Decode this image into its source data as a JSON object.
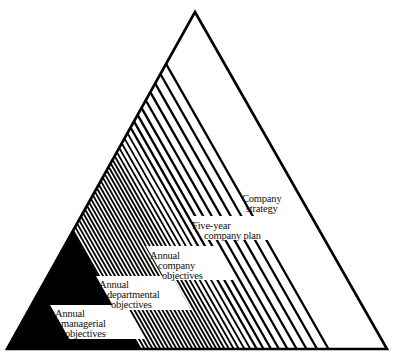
{
  "diagram": {
    "type": "pyramid-hierarchy",
    "triangle": {
      "apex": [
        195,
        12
      ],
      "base_left": [
        7,
        349
      ],
      "base_right": [
        387,
        349
      ],
      "stroke": "#000000",
      "fill": "#ffffff"
    },
    "colors": {
      "ink": "#000000",
      "paper": "#ffffff"
    },
    "levels": [
      {
        "id": "company-strategy",
        "lines": [
          "Company",
          "strategy"
        ],
        "pos": [
          242,
          194
        ],
        "box": false
      },
      {
        "id": "five-year-company-plan",
        "lines": [
          "Five-year",
          "company plan"
        ],
        "pos": [
          196,
          222
        ],
        "box": true
      },
      {
        "id": "annual-company-objectives",
        "lines": [
          "Annual",
          "company",
          "objectives"
        ],
        "pos": [
          151,
          251
        ],
        "box": true
      },
      {
        "id": "annual-departmental-objectives",
        "lines": [
          "Annual",
          "departmental",
          "objectives"
        ],
        "pos": [
          99,
          280
        ],
        "box": true
      },
      {
        "id": "annual-managerial-objectives",
        "lines": [
          "Annual",
          "managerial",
          "objectives"
        ],
        "pos": [
          55,
          309
        ],
        "box": true
      }
    ]
  }
}
